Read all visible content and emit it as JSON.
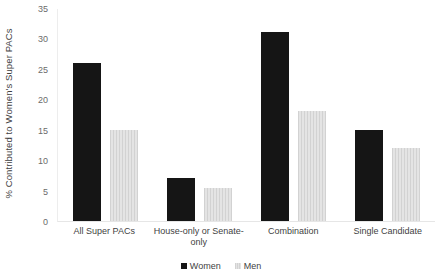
{
  "chart_data": {
    "type": "bar",
    "title": "",
    "xlabel": "",
    "ylabel": "%  Contributed to Women's Super PACs",
    "ylim": [
      0,
      35
    ],
    "ytick_step": 5,
    "yticks": [
      "0",
      "5",
      "10",
      "15",
      "20",
      "25",
      "30",
      "35"
    ],
    "grid": false,
    "legend_position": "bottom-center",
    "categories": [
      "All Super PACs",
      "House-only or Senate-only",
      "Combination",
      "Single Candidate"
    ],
    "series": [
      {
        "name": "Women",
        "color": "#151515",
        "values": [
          26,
          7,
          31,
          15
        ]
      },
      {
        "name": "Men",
        "color": "#dcdcdc",
        "values": [
          15,
          5.5,
          18,
          12
        ]
      }
    ]
  },
  "legend": {
    "items": [
      {
        "label": "Women"
      },
      {
        "label": "Men"
      }
    ]
  }
}
